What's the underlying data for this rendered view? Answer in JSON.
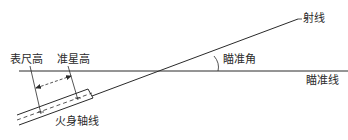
{
  "diagram": {
    "type": "aiming-geometry",
    "labels": {
      "line_of_fire": "射线",
      "aiming_angle": "瞄准角",
      "line_of_sight": "瞄准线",
      "sight_height": "表尺高",
      "front_sight_height": "准星高",
      "bore_axis": "火身轴线"
    },
    "colors": {
      "line": "#2a2a2a",
      "background": "#ffffff"
    }
  }
}
